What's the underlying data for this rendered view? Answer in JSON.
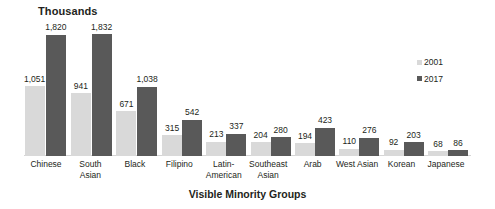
{
  "chart_data": {
    "type": "bar",
    "title": "Thousands",
    "xlabel": "Visible Minority Groups",
    "ylabel": "",
    "ylim": [
      0,
      1832
    ],
    "grid": false,
    "legend_position": "top-right",
    "categories": [
      "Chinese",
      "South\nAsian",
      "Black",
      "Filipino",
      "Latin-\nAmerican",
      "Southeast\nAsian",
      "Arab",
      "West Asian",
      "Korean",
      "Japanese"
    ],
    "series": [
      {
        "name": "2001",
        "color": "#d9d9d9",
        "values": [
          1051,
          941,
          671,
          315,
          213,
          204,
          194,
          110,
          92,
          68
        ],
        "labels": [
          "1,051",
          "941",
          "671",
          "315",
          "213",
          "204",
          "194",
          "110",
          "92",
          "68"
        ]
      },
      {
        "name": "2017",
        "color": "#595959",
        "values": [
          1820,
          1832,
          1038,
          542,
          337,
          280,
          423,
          276,
          203,
          86
        ],
        "labels": [
          "1,820",
          "1,832",
          "1,038",
          "542",
          "337",
          "280",
          "423",
          "276",
          "203",
          "86"
        ]
      }
    ]
  },
  "legend": {
    "items": [
      {
        "label": "2001",
        "color": "#d9d9d9"
      },
      {
        "label": "2017",
        "color": "#595959"
      }
    ]
  }
}
